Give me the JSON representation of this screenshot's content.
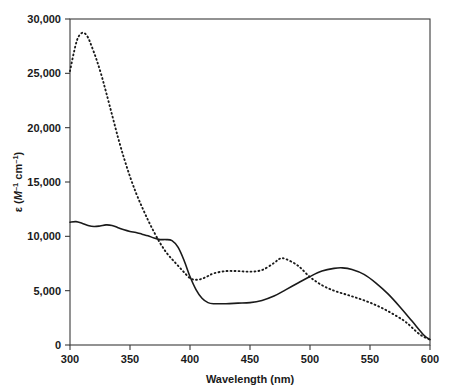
{
  "figure": {
    "background_color": "#ffffff",
    "line_color": "#1a1a1a",
    "frame_color": "#3a3a3a"
  },
  "axes": {
    "x_title_parts": {
      "name": "Wavelength",
      "unit": "(nm)"
    },
    "x_title": "Wavelength (nm)",
    "y_title": "ε (M⁻¹ cm⁻¹)",
    "y_title_parts": {
      "epsilon": "ε",
      "open": "(",
      "molar": "M",
      "molar_exp": "–1",
      "space": " cm",
      "cm_exp": "–1",
      "close": ")"
    },
    "x_ticks": [
      "300",
      "350",
      "400",
      "450",
      "500",
      "550",
      "600"
    ],
    "y_ticks": [
      "0",
      "5,000",
      "10,000",
      "15,000",
      "20,000",
      "25,000",
      "30,000"
    ]
  },
  "chart_data": {
    "type": "line",
    "title": "",
    "xlabel": "Wavelength (nm)",
    "ylabel": "ε (M⁻¹ cm⁻¹)",
    "xlim": [
      300,
      600
    ],
    "ylim": [
      0,
      30000
    ],
    "xticks": [
      300,
      350,
      400,
      450,
      500,
      550,
      600
    ],
    "yticks": [
      0,
      5000,
      10000,
      15000,
      20000,
      25000,
      30000
    ],
    "grid": false,
    "legend": "none",
    "series": [
      {
        "name": "solid-spectrum",
        "style": "solid",
        "color": "#1a1a1a",
        "x": [
          300,
          305,
          310,
          315,
          320,
          325,
          330,
          335,
          340,
          345,
          350,
          355,
          360,
          365,
          370,
          375,
          380,
          385,
          390,
          395,
          400,
          405,
          410,
          415,
          420,
          430,
          440,
          450,
          460,
          470,
          480,
          490,
          500,
          510,
          520,
          527,
          535,
          545,
          555,
          565,
          575,
          585,
          595,
          600
        ],
        "y": [
          11300,
          11350,
          11200,
          11000,
          10900,
          10950,
          11050,
          11000,
          10800,
          10600,
          10450,
          10350,
          10200,
          10050,
          9850,
          9700,
          9700,
          9600,
          9000,
          7800,
          6300,
          5100,
          4300,
          3900,
          3800,
          3800,
          3850,
          3900,
          4100,
          4500,
          5100,
          5700,
          6300,
          6800,
          7050,
          7100,
          6950,
          6500,
          5700,
          4700,
          3500,
          2200,
          900,
          500
        ]
      },
      {
        "name": "dashed-spectrum",
        "style": "dashed",
        "color": "#1a1a1a",
        "x": [
          300,
          303,
          306,
          309,
          312,
          315,
          318,
          322,
          326,
          330,
          335,
          340,
          345,
          350,
          355,
          360,
          365,
          370,
          375,
          380,
          385,
          390,
          395,
          400,
          405,
          410,
          415,
          420,
          430,
          440,
          450,
          460,
          470,
          475,
          480,
          490,
          500,
          510,
          520,
          530,
          540,
          550,
          560,
          570,
          580,
          590,
          595,
          600
        ],
        "y": [
          25200,
          26800,
          28100,
          28650,
          28700,
          28300,
          27500,
          26300,
          24900,
          23300,
          21200,
          19100,
          17200,
          15500,
          14000,
          12700,
          11500,
          10400,
          9400,
          8550,
          7900,
          7300,
          6700,
          6150,
          6000,
          6100,
          6350,
          6600,
          6800,
          6800,
          6750,
          6900,
          7550,
          7950,
          7900,
          7300,
          6250,
          5500,
          5000,
          4650,
          4300,
          3900,
          3400,
          2800,
          2100,
          1100,
          750,
          500
        ]
      }
    ]
  }
}
